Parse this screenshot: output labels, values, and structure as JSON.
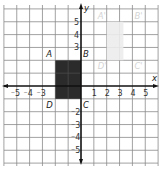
{
  "diagram": {
    "type": "coordinate-plane",
    "axes": {
      "x_label": "x",
      "y_label": "y",
      "range": {
        "x": [
          -5,
          5
        ],
        "y": [
          -5,
          5
        ]
      }
    },
    "x_tick_labels": [
      "⁻5",
      "⁻4",
      "⁻3",
      "1",
      "2",
      "3",
      "4",
      "5"
    ],
    "x_tick_values": [
      -5,
      -4,
      -3,
      1,
      2,
      3,
      4,
      5
    ],
    "y_tick_labels": [
      "5",
      "4",
      "3",
      "⁻2",
      "⁻3",
      "⁻4",
      "⁻5"
    ],
    "y_tick_values": [
      5,
      4,
      3,
      -2,
      -3,
      -4,
      -5
    ],
    "shapes": [
      {
        "name": "ABCD",
        "style": "dark-filled",
        "fill": "#2b2b2b",
        "vertices": [
          {
            "label": "A",
            "x": -2,
            "y": 2
          },
          {
            "label": "B",
            "x": 0,
            "y": 2
          },
          {
            "label": "C",
            "x": 0,
            "y": -1
          },
          {
            "label": "D",
            "x": -2,
            "y": -1
          }
        ]
      },
      {
        "name": "A'B'C'D'",
        "style": "faded",
        "fill": "#ececec",
        "vertices": [
          {
            "label": "A'",
            "x": 2,
            "y": 5
          },
          {
            "label": "B'",
            "x": 4,
            "y": 5
          },
          {
            "label": "C'",
            "x": 4,
            "y": 2
          },
          {
            "label": "D'",
            "x": 2,
            "y": 2
          }
        ]
      }
    ]
  }
}
